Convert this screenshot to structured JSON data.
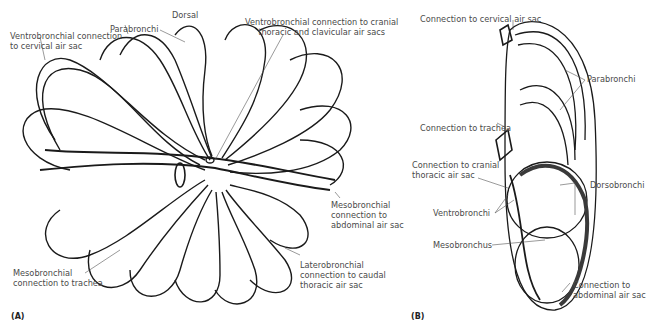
{
  "figure": {
    "panels": [
      {
        "id": "A",
        "panel_label": "(A)",
        "labels": {
          "dorsal": "Dorsal",
          "parabronchi": "Parabronchi",
          "ventro_cervical": [
            "Ventrobronchial connection",
            "to cervical air sac"
          ],
          "ventro_cranial": [
            "Ventrobronchial connection to cranial",
            "thoracic and clavicular air sacs"
          ],
          "meso_abdominal": [
            "Mesobronchial",
            "connection to",
            "abdominal air sac"
          ],
          "latero_caudal": [
            "Laterobronchial",
            "connection to caudal",
            "thoracic air sac"
          ],
          "meso_trachea": [
            "Mesobronchial",
            "connection to trachea"
          ]
        }
      },
      {
        "id": "B",
        "panel_label": "(B)",
        "labels": {
          "cervical": "Connection to cervical air sac",
          "parabronchi": "Parabronchi",
          "trachea": "Connection to trachea",
          "cranial_thoracic": [
            "Connection to cranial",
            "thoracic air sac"
          ],
          "dorsobronchi": "Dorsobronchi",
          "ventrobronchi": "Ventrobronchi",
          "mesobronchus": "Mesobronchus",
          "abdominal": [
            "Connection to",
            "abdominal air sac"
          ]
        }
      }
    ],
    "colors": {
      "ink": "#1a1a1a",
      "label": "#4a4a4a",
      "background": "#ffffff"
    }
  }
}
